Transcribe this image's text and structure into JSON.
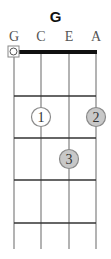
{
  "chord": {
    "name": "G"
  },
  "strings": [
    {
      "label": "G",
      "x": 14
    },
    {
      "label": "C",
      "x": 41
    },
    {
      "label": "E",
      "x": 69
    },
    {
      "label": "A",
      "x": 96
    }
  ],
  "open_marker": {
    "string": "G",
    "symbol": "O"
  },
  "frets": [
    96,
    138,
    180,
    223
  ],
  "fingers": [
    {
      "number": "1",
      "string": "C",
      "fret": 2,
      "fill": "#ffffff"
    },
    {
      "number": "2",
      "string": "A",
      "fret": 2,
      "fill": "#c8c8c8"
    },
    {
      "number": "3",
      "string": "E",
      "fret": 3,
      "fill": "#c8c8c8"
    }
  ],
  "colors": {
    "nut": "#111111",
    "fret": "#333333",
    "string": "#9a9a9a",
    "dot_border": "#8a8a8a"
  }
}
